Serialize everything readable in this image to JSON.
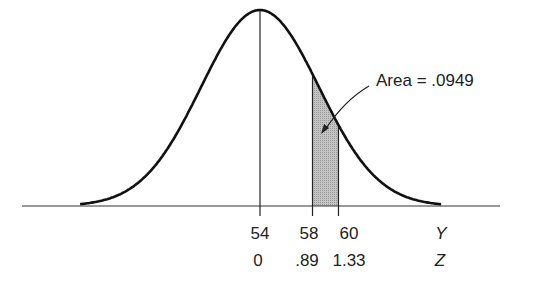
{
  "chart_data": {
    "type": "area",
    "title": "",
    "mean": 54,
    "sd": 4.5,
    "xlabel_rows": [
      {
        "axis_name": "Y",
        "ticks": [
          "54",
          "58",
          "60"
        ]
      },
      {
        "axis_name": "Z",
        "ticks": [
          "0",
          ".89",
          "1.33"
        ]
      }
    ],
    "y_values": [
      54,
      58,
      60
    ],
    "z_values": [
      0,
      0.89,
      1.33
    ],
    "shaded_region": {
      "from_y": 58,
      "to_y": 60,
      "from_z": 0.89,
      "to_z": 1.33
    },
    "annotation": "Area = .0949",
    "area": 0.0949,
    "grid": false,
    "legend": null
  },
  "labels": {
    "y_ticks": [
      "54",
      "58",
      "60"
    ],
    "z_ticks": [
      "0",
      ".89",
      "1.33"
    ],
    "y_axis_name": "Y",
    "z_axis_name": "Z",
    "annotation": "Area = .0949"
  },
  "colors": {
    "curve": "#111111",
    "shade": "#bdbdbd",
    "axis": "#333333"
  }
}
